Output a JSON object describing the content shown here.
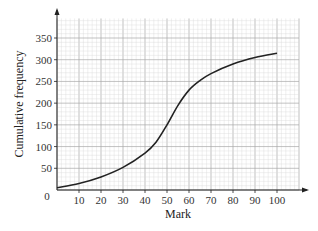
{
  "chart_data": {
    "type": "line",
    "title": "",
    "xlabel": "Mark",
    "ylabel": "Cumulative frequency",
    "x_ticks": [
      10,
      20,
      30,
      40,
      50,
      60,
      70,
      80,
      90,
      100
    ],
    "y_ticks": [
      50,
      100,
      150,
      200,
      250,
      300,
      350
    ],
    "origin_label": "0",
    "xlim": [
      0,
      110
    ],
    "ylim": [
      0,
      395
    ],
    "grid": true,
    "legend": null,
    "series": [
      {
        "name": "Cumulative frequency",
        "x": [
          0,
          10,
          20,
          30,
          40,
          45,
          50,
          55,
          60,
          65,
          70,
          80,
          90,
          100
        ],
        "y": [
          5,
          15,
          30,
          52,
          85,
          110,
          150,
          195,
          230,
          252,
          268,
          290,
          305,
          315
        ]
      }
    ]
  },
  "colors": {
    "minor_grid": "#d9d9d9",
    "major_grid": "#a8a8a8",
    "axis": "#222222",
    "curve": "#222222"
  }
}
